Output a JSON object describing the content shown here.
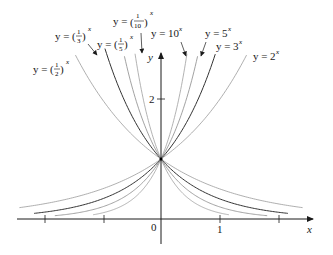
{
  "figure": {
    "type": "exponential-functions-graph",
    "axes": {
      "x_label": "x",
      "y_label": "y",
      "x_tick_labels": [
        {
          "value": 0,
          "text": "0"
        },
        {
          "value": 1,
          "text": "1"
        }
      ],
      "y_tick_labels": [
        {
          "value": 2,
          "text": "2"
        }
      ],
      "x_ticks": [
        -2,
        -1,
        0,
        1,
        2
      ],
      "y_ticks": [
        2
      ]
    },
    "common_point": {
      "x": 0,
      "y": 1
    },
    "curves": [
      {
        "id": "half",
        "base": 0.5,
        "label_prefix": "y = (",
        "num": "1",
        "den": "2",
        "label_suffix": ")",
        "exp": "x",
        "color": "#9a9a9a",
        "width": 0.8,
        "x_range": [
          -1.45,
          2.4
        ]
      },
      {
        "id": "third",
        "base": 0.3333,
        "label_prefix": "y = (",
        "num": "1",
        "den": "3",
        "label_suffix": ")",
        "exp": "x",
        "color": "#333333",
        "width": 1.0,
        "x_range": [
          -0.95,
          2.15
        ]
      },
      {
        "id": "fifth",
        "base": 0.2,
        "label_prefix": "y = (",
        "num": "1",
        "den": "5",
        "label_suffix": ")",
        "exp": "x",
        "color": "#8a8a8a",
        "width": 0.8,
        "x_range": [
          -0.62,
          1.8
        ]
      },
      {
        "id": "tenth",
        "base": 0.1,
        "label_prefix": "y = (",
        "num": "1",
        "den": "10",
        "label_suffix": ")",
        "exp": "x",
        "color": "#a0a0a0",
        "width": 0.8,
        "x_range": [
          -0.44,
          1.15
        ]
      },
      {
        "id": "ten",
        "base": 10,
        "label": "y = 10",
        "exp": "x",
        "color": "#a0a0a0",
        "width": 0.8,
        "x_range": [
          -1.15,
          0.44
        ]
      },
      {
        "id": "five",
        "base": 5,
        "label": "y = 5",
        "exp": "x",
        "color": "#8a8a8a",
        "width": 0.8,
        "x_range": [
          -1.8,
          0.62
        ]
      },
      {
        "id": "three",
        "base": 3,
        "label": "y = 3",
        "exp": "x",
        "color": "#333333",
        "width": 1.0,
        "x_range": [
          -2.15,
          0.92
        ]
      },
      {
        "id": "two",
        "base": 2,
        "label": "y = 2",
        "exp": "x",
        "color": "#9a9a9a",
        "width": 0.8,
        "x_range": [
          -2.4,
          1.45
        ]
      }
    ],
    "labels": {
      "half": "y = (1/2)^x",
      "third": "y = (1/3)^x",
      "fifth": "y = (1/5)^x",
      "tenth": "y = (1/10)^x",
      "ten": "y = 10^x",
      "five": "y = 5^x",
      "three": "y = 3^x",
      "two": "y = 2^x"
    },
    "text": {
      "y_eq": "y = ",
      "x": "x",
      "ten_base": "10",
      "five_base": "5",
      "three_base": "3",
      "two_base": "2",
      "one": "1",
      "two_den": "2",
      "three_den": "3",
      "five_den": "5",
      "ten_den": "10",
      "tick_0": "0",
      "tick_1": "1",
      "tick_y2": "2",
      "axis_x": "x",
      "axis_y": "y"
    }
  }
}
